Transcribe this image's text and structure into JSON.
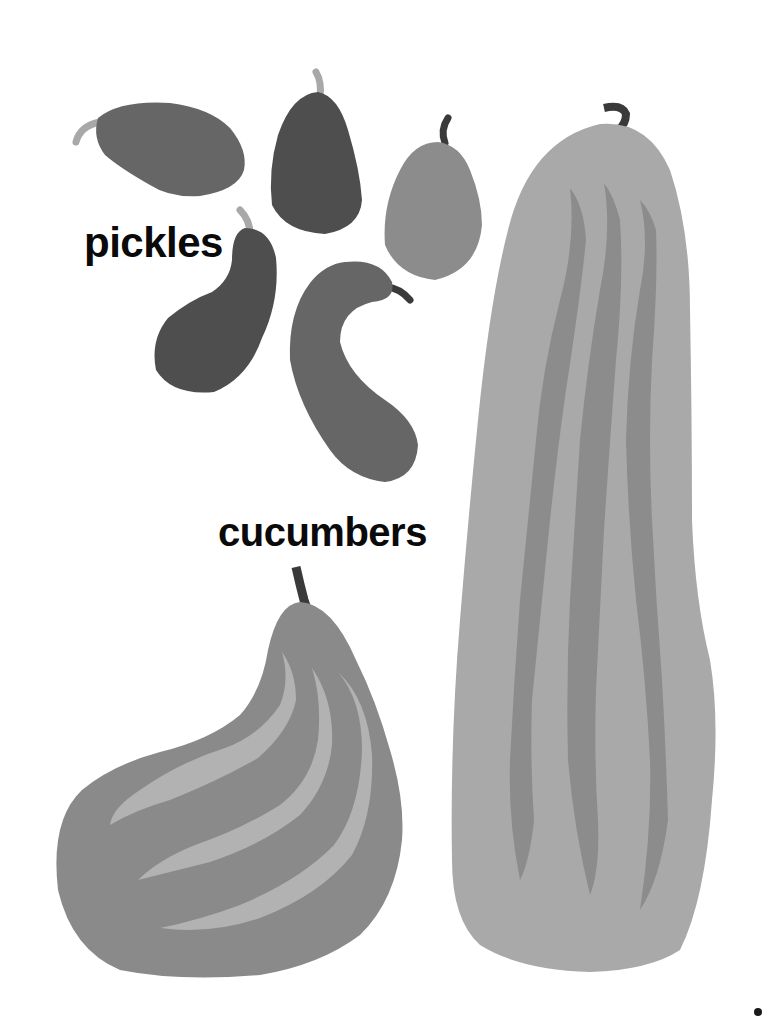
{
  "labels": {
    "pickles": "pickles",
    "cucumbers": "cucumbers"
  },
  "illustration": {
    "pickles_count": 5,
    "cucumbers_count": 2
  },
  "colors": {
    "background": "#ffffff",
    "text": "#0a0a0a",
    "pickle_dark": "#4e4e4e",
    "pickle_medium": "#666666",
    "pickle_light": "#8c8c8c",
    "stem_light": "#a8a8a8",
    "stem_dark": "#3a3a3a",
    "gourd_body": "#8a8a8a",
    "gourd_stripe": "#b2b2b2",
    "cucumber_body": "#a9a9a9",
    "cucumber_stripe": "#8c8c8c"
  }
}
